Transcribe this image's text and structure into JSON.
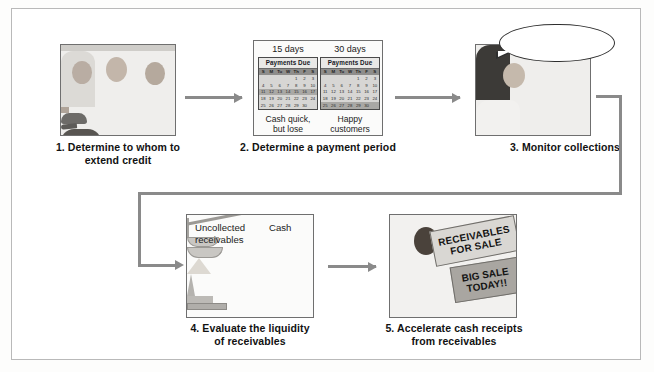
{
  "figure": {
    "steps": [
      {
        "number": "1",
        "caption": "1. Determine to whom to\nextend credit",
        "caption_line1": "1. Determine to whom to",
        "caption_line2": "extend credit",
        "illustration": "three-people-credit-discussion"
      },
      {
        "number": "2",
        "caption_line1": "2. Determine a payment period",
        "caption_line2": "",
        "illustration": "two-calendars-payments-due"
      },
      {
        "number": "3",
        "caption_line1": "3. Monitor collections",
        "caption_line2": "",
        "illustration": "person-at-computer-calling"
      },
      {
        "number": "4",
        "caption_line1": "4. Evaluate the liquidity",
        "caption_line2": "of receivables",
        "illustration": "balance-scale"
      },
      {
        "number": "5",
        "caption_line1": "5. Accelerate cash receipts",
        "caption_line2": "from receivables",
        "illustration": "person-with-sale-signs"
      }
    ]
  },
  "panel2": {
    "calendar_left": {
      "days_label": "15 days",
      "title": "Payments Due",
      "dow": [
        "S",
        "M",
        "Tu",
        "W",
        "Th",
        "F",
        "S"
      ],
      "weeks": [
        [
          "",
          "",
          "",
          "",
          "1",
          "2",
          "3"
        ],
        [
          "4",
          "5",
          "6",
          "7",
          "8",
          "9",
          "10"
        ],
        [
          "11",
          "12",
          "13",
          "14",
          "15",
          "16",
          "17"
        ],
        [
          "18",
          "19",
          "20",
          "21",
          "22",
          "23",
          "24"
        ],
        [
          "25",
          "26",
          "27",
          "28",
          "29",
          "30",
          ""
        ]
      ],
      "highlight_week_index": 2,
      "note_line1": "Cash quick,",
      "note_line2": "but lose",
      "note_line3": "sales"
    },
    "calendar_right": {
      "days_label": "30 days",
      "title": "Payments Due",
      "dow": [
        "S",
        "M",
        "Tu",
        "W",
        "Th",
        "F",
        "S"
      ],
      "weeks": [
        [
          "",
          "",
          "",
          "",
          "1",
          "2",
          "3"
        ],
        [
          "4",
          "5",
          "6",
          "7",
          "8",
          "9",
          "10"
        ],
        [
          "11",
          "12",
          "13",
          "14",
          "15",
          "16",
          "17"
        ],
        [
          "18",
          "19",
          "20",
          "21",
          "22",
          "23",
          "24"
        ],
        [
          "25",
          "26",
          "27",
          "28",
          "29",
          "30",
          ""
        ]
      ],
      "highlight_week_index": 4,
      "note_line1": "Happy customers",
      "note_line2": "but less cash",
      "note_line3": "available"
    }
  },
  "panel3": {
    "speech_bubble_line1": "Hi, you owe our",
    "speech_bubble_line2": "company money",
    "speech_bubble_text": "Hi, you owe our company money"
  },
  "panel4": {
    "label_left_line1": "Uncollected",
    "label_left_line2": "receivables",
    "label_right": "Cash"
  },
  "panel5": {
    "sign_main_line1": "RECEIVABLES",
    "sign_main_line2": "FOR SALE",
    "sign_secondary_line1": "BIG SALE",
    "sign_secondary_line2": "TODAY!!"
  },
  "colors": {
    "frame_border": "#b9b9b9",
    "panel_border": "#6f6f6f",
    "arrow": "#8a8a8a",
    "text": "#121212",
    "calendar_header": "#e9e8e6",
    "calendar_body": "#d7d6d4",
    "sign_light": "#d9d7d3",
    "sign_dark": "#a9a6a1",
    "background": "#ffffff"
  }
}
